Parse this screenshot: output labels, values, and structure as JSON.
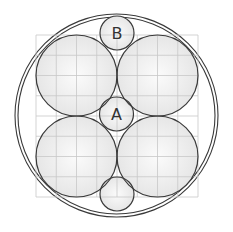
{
  "diagram": {
    "type": "circle-packing",
    "colors": {
      "background": "#ffffff",
      "grid": "#c8c8c8",
      "stroke": "#3a3a3a",
      "fill_center": "#fbfbfb",
      "fill_edge": "#e4e4e4",
      "label": "#333333"
    },
    "outer_circles": [
      {
        "name": "outer-ring-outer",
        "cx": 116.5,
        "cy": 115.5,
        "r": 101.5
      },
      {
        "name": "outer-ring-inner",
        "cx": 116.5,
        "cy": 115.5,
        "r": 98.5
      }
    ],
    "grid": {
      "x0": 36,
      "y0": 35,
      "size": 162,
      "divisions": 8
    },
    "large_circles": [
      {
        "name": "large-circle-top-left",
        "cx": 76.5,
        "cy": 75.5,
        "r": 40.5
      },
      {
        "name": "large-circle-top-right",
        "cx": 157.5,
        "cy": 75.5,
        "r": 40.5
      },
      {
        "name": "large-circle-bottom-left",
        "cx": 76.5,
        "cy": 156.5,
        "r": 40.5
      },
      {
        "name": "large-circle-bottom-right",
        "cx": 157.5,
        "cy": 156.5,
        "r": 40.5
      }
    ],
    "small_circles": [
      {
        "name": "small-circle-b",
        "cx": 117,
        "cy": 33,
        "r": 17,
        "label": "B"
      },
      {
        "name": "small-circle-a",
        "cx": 116.5,
        "cy": 114,
        "r": 17,
        "label": "A"
      },
      {
        "name": "small-circle-bottom",
        "cx": 117,
        "cy": 194,
        "r": 17,
        "label": ""
      }
    ]
  }
}
